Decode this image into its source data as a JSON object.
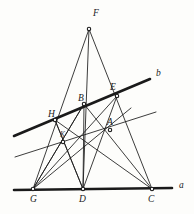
{
  "figure": {
    "background_color": "#fdfdfb",
    "ink_color": "#1a1a1a",
    "width": 194,
    "height": 214
  },
  "labels": {
    "F": "F",
    "B": "B",
    "E": "E",
    "H": "H",
    "A": "A",
    "K": "K",
    "G": "G",
    "D": "D",
    "C": "C",
    "line_a": "a",
    "line_b": "b"
  },
  "chart_data": {
    "type": "diagram",
    "xlim": [
      0,
      194
    ],
    "ylim": [
      0,
      214
    ],
    "grid": false,
    "points": [
      {
        "name": "F",
        "x": 89,
        "y": 29,
        "label": "F",
        "label_x": 93,
        "label_y": 16
      },
      {
        "name": "B",
        "x": 84,
        "y": 104,
        "label": "B",
        "label_x": 78,
        "label_y": 101
      },
      {
        "name": "E",
        "x": 117,
        "y": 96,
        "label": "E",
        "label_x": 110,
        "label_y": 90
      },
      {
        "name": "H",
        "x": 55,
        "y": 120,
        "label": "H",
        "label_x": 48,
        "label_y": 117
      },
      {
        "name": "A",
        "x": 110,
        "y": 130,
        "label": "A",
        "label_x": 107,
        "label_y": 125
      },
      {
        "name": "K",
        "x": 63,
        "y": 142,
        "label": "K",
        "label_x": 60,
        "label_y": 137
      },
      {
        "name": "G",
        "x": 33,
        "y": 189,
        "label": "G",
        "label_x": 30,
        "label_y": 202
      },
      {
        "name": "D",
        "x": 83,
        "y": 189,
        "label": "D",
        "label_x": 79,
        "label_y": 202
      },
      {
        "name": "C",
        "x": 152,
        "y": 189,
        "label": "C",
        "label_x": 148,
        "label_y": 202
      }
    ],
    "lines": [
      {
        "name": "line-a-baseline",
        "from": [
          14,
          190
        ],
        "to": [
          172,
          188
        ],
        "weight": "thick",
        "label": "a",
        "label_x": 179,
        "label_y": 188
      },
      {
        "name": "line-b-transversal",
        "from": [
          14,
          136
        ],
        "to": [
          150,
          79
        ],
        "weight": "thick",
        "label": "b",
        "label_x": 156,
        "label_y": 76
      },
      {
        "name": "line-parallel-lower",
        "from": [
          15,
          157
        ],
        "to": [
          156,
          112
        ],
        "weight": "thin"
      },
      {
        "name": "F-G",
        "from": [
          89,
          29
        ],
        "to": [
          33,
          189
        ],
        "weight": "thin"
      },
      {
        "name": "F-D",
        "from": [
          89,
          29
        ],
        "to": [
          83,
          189
        ],
        "weight": "thin"
      },
      {
        "name": "F-C",
        "from": [
          89,
          29
        ],
        "to": [
          152,
          189
        ],
        "weight": "thin"
      },
      {
        "name": "G-E",
        "from": [
          33,
          189
        ],
        "to": [
          117,
          96
        ],
        "weight": "thin"
      },
      {
        "name": "G-B",
        "from": [
          33,
          189
        ],
        "to": [
          84,
          104
        ],
        "weight": "thin"
      },
      {
        "name": "D-H",
        "from": [
          83,
          189
        ],
        "to": [
          55,
          120
        ],
        "weight": "thin"
      },
      {
        "name": "D-B",
        "from": [
          83,
          189
        ],
        "to": [
          84,
          104
        ],
        "weight": "thin"
      },
      {
        "name": "D-E",
        "from": [
          83,
          189
        ],
        "to": [
          117,
          96
        ],
        "weight": "thin"
      },
      {
        "name": "C-B",
        "from": [
          152,
          189
        ],
        "to": [
          84,
          104
        ],
        "weight": "thin"
      },
      {
        "name": "C-H",
        "from": [
          152,
          189
        ],
        "to": [
          55,
          120
        ],
        "weight": "thin"
      },
      {
        "name": "G-A-extended",
        "from": [
          33,
          189
        ],
        "to": [
          131,
          108
        ],
        "weight": "thin"
      },
      {
        "name": "H-K-D",
        "from": [
          55,
          120
        ],
        "to": [
          83,
          189
        ],
        "weight": "thin"
      },
      {
        "name": "B-K-G",
        "from": [
          84,
          104
        ],
        "to": [
          33,
          189
        ],
        "weight": "thin"
      }
    ]
  }
}
